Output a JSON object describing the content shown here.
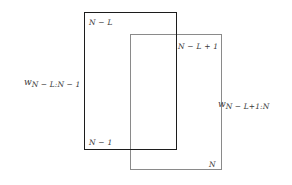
{
  "figure": {
    "outer_window": {
      "name": "first-window",
      "top_label": "N − L",
      "bottom_label": "N − 1",
      "side_label_symbol": "w",
      "side_label_subscript": "N − L:N − 1",
      "stroke_color": "#1c1c1c"
    },
    "inner_window": {
      "name": "second-window",
      "top_label": "N − L + 1",
      "bottom_label": "N",
      "side_label_symbol": "w",
      "side_label_subscript": "N − L+1:N",
      "stroke_color": "#8a8a8a"
    },
    "background_color": "#ffffff"
  }
}
